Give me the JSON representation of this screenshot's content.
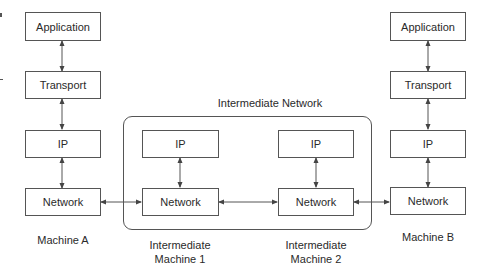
{
  "diagram": {
    "machine_a": {
      "label": "Machine A",
      "layers": [
        "Application",
        "Transport",
        "IP",
        "Network"
      ]
    },
    "machine_b": {
      "label": "Machine B",
      "layers": [
        "Application",
        "Transport",
        "IP",
        "Network"
      ]
    },
    "intermediate_network": {
      "title": "Intermediate Network",
      "machine_1": {
        "label_line1": "Intermediate",
        "label_line2": "Machine 1",
        "layers": [
          "IP",
          "Network"
        ]
      },
      "machine_2": {
        "label_line1": "Intermediate",
        "label_line2": "Machine 2",
        "layers": [
          "IP",
          "Network"
        ]
      }
    },
    "colors": {
      "line": "#555555",
      "text": "#2a2a2a",
      "background": "#ffffff"
    }
  }
}
